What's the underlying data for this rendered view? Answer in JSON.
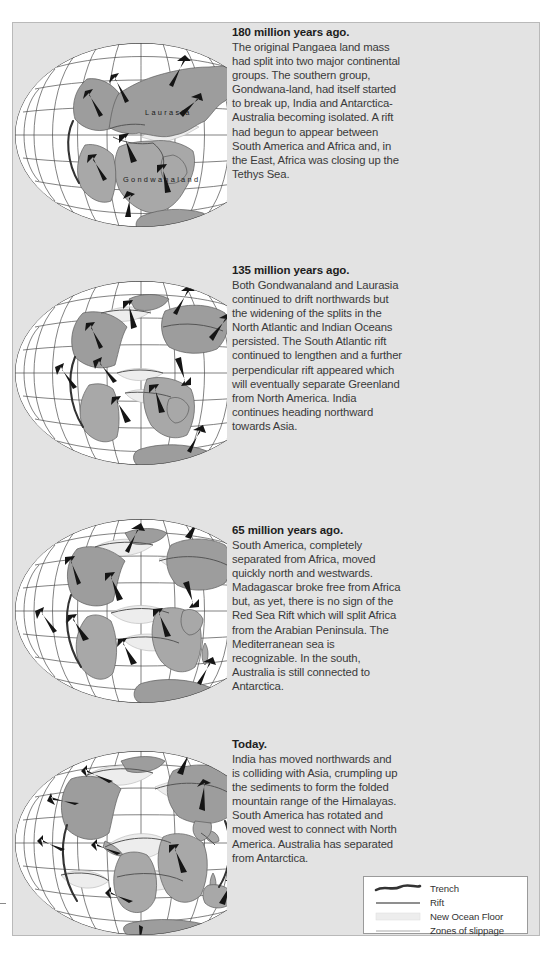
{
  "figure": {
    "attribution": "(After Dietz & Holden,Sci. Am. 1970)",
    "background_color": "#e3e3e3",
    "panel_border_color": "#b9b9b9",
    "land_color": "#9d9d9d",
    "ocean_color": "#ffffff",
    "new_ocean_floor_color": "#ededed"
  },
  "panels": [
    {
      "id": "panel-180",
      "heading": "180 million years ago.",
      "body": "The original Pangaea land mass had split into two major continental groups. The southern group, Gondwana-land, had itself started to break up, India and Antarctica-Australia becoming isolated. A rift had begun to appear between South America and Africa and, in the East, Africa was closing up the Tethys Sea.",
      "map_labels": [
        "Laurasia",
        "Gondwanaland"
      ]
    },
    {
      "id": "panel-135",
      "heading": "135 million years ago.",
      "body": "Both Gondwanaland and Laurasia continued to drift northwards but the widening of the splits in the North Atlantic and Indian Oceans persisted. The South Atlantic rift continued to lengthen and a further perpendicular rift appeared which will eventually separate Greenland from North America. India continues heading northward towards Asia.",
      "map_labels": []
    },
    {
      "id": "panel-65",
      "heading": "65 million years ago.",
      "body": "South America, completely separated from Africa, moved quickly north and westwards. Madagascar broke free from Africa but, as yet, there is no sign of the Red Sea Rift which will split Africa from the Arabian Peninsula. The Mediterranean sea is recognizable. In the south, Australia is still connected to Antarctica.",
      "map_labels": []
    },
    {
      "id": "panel-today",
      "heading": "Today.",
      "body": "India has moved northwards and is colliding with Asia, crumpling up the sediments to form the folded mountain range of the Himalayas. South America has rotated and moved west to connect with North America. Australia has separated from Antarctica.",
      "map_labels": []
    }
  ],
  "legend": {
    "items": [
      {
        "symbol": "trench-symbol",
        "label": "Trench"
      },
      {
        "symbol": "rift-symbol",
        "label": "Rift"
      },
      {
        "symbol": "new-ocean-floor-symbol",
        "label": "New Ocean Floor"
      },
      {
        "symbol": "zones-of-slippage-symbol",
        "label": "Zones of slippage"
      }
    ]
  }
}
